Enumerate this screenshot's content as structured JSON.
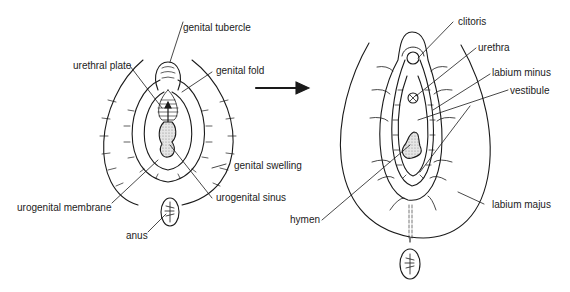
{
  "figure": {
    "panels": [
      {
        "id": "indifferent-stage",
        "labels": {
          "genital_tubercle": "genital tubercle",
          "urethral_plate": "urethral plate",
          "genital_fold": "genital fold",
          "genital_swelling": "genital swelling",
          "urogenital_membrane": "urogenital membrane",
          "urogenital_sinus": "urogenital sinus",
          "anus": "anus"
        }
      },
      {
        "id": "female-external-genitalia",
        "labels": {
          "clitoris": "clitoris",
          "urethra": "urethra",
          "labium_minus": "labium minus",
          "vestibule": "vestibule",
          "hymen": "hymen",
          "labium_majus": "labium majus"
        }
      }
    ],
    "arrow": "right-arrow",
    "colors": {
      "line": "#1a1a1a",
      "stipple": "#bdbdbd",
      "background": "#ffffff"
    }
  }
}
